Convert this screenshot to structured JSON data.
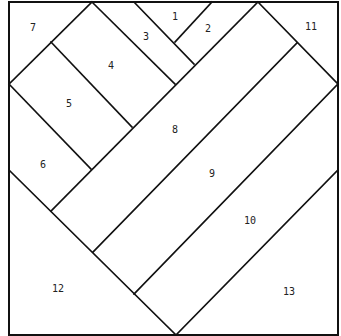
{
  "diagram": {
    "title": "",
    "stroke_color": "#111111",
    "background": "#ffffff",
    "pieces": [
      {
        "id": "1",
        "label": "1",
        "x": 175,
        "y": 17
      },
      {
        "id": "2",
        "label": "2",
        "x": 208,
        "y": 29
      },
      {
        "id": "3",
        "label": "3",
        "x": 146,
        "y": 37
      },
      {
        "id": "4",
        "label": "4",
        "x": 111,
        "y": 66
      },
      {
        "id": "5",
        "label": "5",
        "x": 69,
        "y": 104
      },
      {
        "id": "6",
        "label": "6",
        "x": 43,
        "y": 165
      },
      {
        "id": "7",
        "label": "7",
        "x": 33,
        "y": 28
      },
      {
        "id": "8",
        "label": "8",
        "x": 175,
        "y": 130
      },
      {
        "id": "9",
        "label": "9",
        "x": 212,
        "y": 174
      },
      {
        "id": "10",
        "label": "10",
        "x": 250,
        "y": 221
      },
      {
        "id": "11",
        "label": "11",
        "x": 311,
        "y": 27
      },
      {
        "id": "12",
        "label": "12",
        "x": 58,
        "y": 289
      },
      {
        "id": "13",
        "label": "13",
        "x": 289,
        "y": 292
      }
    ]
  }
}
